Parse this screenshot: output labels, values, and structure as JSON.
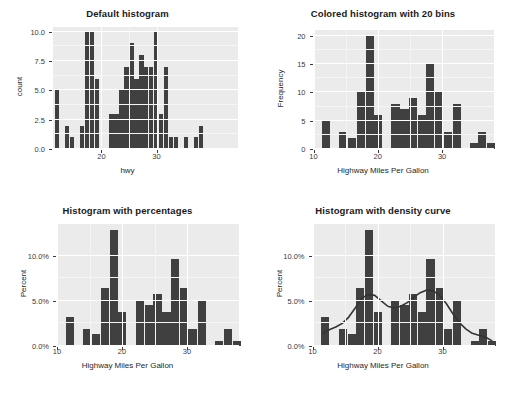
{
  "figure": {
    "layout": "2x2 grid of histogram panels",
    "background": "#ffffff",
    "panel_bg": "#ebebeb",
    "bar_color": "#404040",
    "grid_color": "#ffffff",
    "text_color": "#1a1a1a"
  },
  "panels": [
    {
      "id": "default-histogram",
      "title": "Default histogram",
      "xlabel": "hwy",
      "ylabel": "count"
    },
    {
      "id": "colored-histogram-20-bins",
      "title": "Colored histogram with 20 bins",
      "xlabel": "Highway Miles Per Gallon",
      "ylabel": "Frequency"
    },
    {
      "id": "histogram-percentages",
      "title": "Histogram with percentages",
      "xlabel": "Highway Miles Per Gallon",
      "ylabel": "Percent"
    },
    {
      "id": "histogram-density-curve",
      "title": "Histogram with density curve",
      "xlabel": "Highway Miles Per Gallon",
      "ylabel": "Percent"
    }
  ],
  "chart_data": [
    {
      "type": "bar",
      "id": "default-histogram",
      "title": "Default histogram",
      "xlabel": "hwy",
      "ylabel": "count",
      "bins": 30,
      "binwidth": 0.9,
      "xlim": [
        11.2,
        44.8
      ],
      "ylim": [
        0,
        10.4
      ],
      "xticks": [
        20,
        30
      ],
      "xticklabels": [
        "20",
        "30"
      ],
      "yticks": [
        0.0,
        2.5,
        5.0,
        7.5,
        10.0
      ],
      "yticklabels": [
        "0.0",
        "2.5",
        "5.0",
        "7.5",
        "10.0"
      ],
      "grid": true,
      "legend": "none",
      "bin_centers": [
        12.0,
        12.9,
        13.8,
        14.7,
        15.6,
        16.5,
        17.4,
        18.3,
        19.2,
        20.1,
        21.0,
        21.9,
        22.8,
        23.7,
        24.6,
        25.5,
        26.4,
        27.3,
        28.2,
        29.1,
        30.0,
        30.9,
        31.8,
        32.7,
        33.6,
        34.5,
        35.4,
        36.3,
        37.2,
        38.1,
        41.0,
        44.0
      ],
      "values": [
        5,
        0,
        2,
        1,
        0,
        2,
        10,
        10,
        6,
        0,
        0,
        3,
        3,
        5,
        7,
        9,
        6,
        8,
        7,
        7,
        10,
        3,
        7,
        1,
        1,
        0,
        1,
        0,
        1,
        2,
        0,
        0
      ]
    },
    {
      "type": "bar",
      "id": "colored-histogram-20-bins",
      "title": "Colored histogram with 20 bins",
      "xlabel": "Highway Miles Per Gallon",
      "ylabel": "Frequency",
      "bins": 20,
      "binwidth": 1.35,
      "xlim": [
        10,
        38
      ],
      "ylim": [
        0,
        21
      ],
      "xticks": [
        10,
        20,
        30
      ],
      "xticklabels": [
        "10",
        "20",
        "30"
      ],
      "yticks": [
        0,
        5,
        10,
        15,
        20
      ],
      "yticklabels": [
        "0",
        "5",
        "10",
        "15",
        "20"
      ],
      "grid": true,
      "legend": "none",
      "bin_centers": [
        12.0,
        13.4,
        14.7,
        16.1,
        17.4,
        18.8,
        20.1,
        21.5,
        22.8,
        24.2,
        25.5,
        26.9,
        28.2,
        29.6,
        30.9,
        32.3,
        33.6,
        35.0,
        36.3,
        37.7
      ],
      "values": [
        5,
        0,
        3,
        2,
        10,
        20,
        6,
        0,
        8,
        7,
        9,
        6,
        15,
        10,
        3,
        8,
        0,
        1,
        3,
        1
      ]
    },
    {
      "type": "bar",
      "id": "histogram-percentages",
      "title": "Histogram with percentages",
      "xlabel": "Highway Miles Per Gallon",
      "ylabel": "Percent",
      "bins": 20,
      "binwidth": 1.35,
      "xlim": [
        10,
        38
      ],
      "ylim": [
        0,
        13.5
      ],
      "xticks": [
        10,
        20,
        30
      ],
      "xticklabels": [
        "10",
        "20",
        "30"
      ],
      "yticks": [
        0.0,
        5.0,
        10.0
      ],
      "yticklabels": [
        "0.0%",
        "5.0%",
        "10.0%"
      ],
      "grid": true,
      "legend": "none",
      "bin_centers": [
        12.0,
        13.4,
        14.7,
        16.1,
        17.4,
        18.8,
        20.1,
        21.5,
        22.8,
        24.2,
        25.5,
        26.9,
        28.2,
        29.6,
        30.9,
        32.3,
        33.6,
        35.0,
        36.3,
        37.7
      ],
      "values": [
        3.2,
        0.0,
        1.9,
        1.3,
        6.4,
        12.8,
        3.8,
        0.0,
        5.1,
        4.5,
        5.8,
        3.8,
        9.6,
        6.4,
        1.9,
        5.1,
        0.0,
        0.6,
        1.9,
        0.6
      ]
    },
    {
      "type": "bar",
      "id": "histogram-density-curve",
      "title": "Histogram with density curve",
      "xlabel": "Highway Miles Per Gallon",
      "ylabel": "Percent",
      "bins": 20,
      "binwidth": 1.35,
      "xlim": [
        10,
        38
      ],
      "ylim": [
        0,
        13.5
      ],
      "xticks": [
        10,
        20,
        30
      ],
      "xticklabels": [
        "10",
        "20",
        "30"
      ],
      "yticks": [
        0.0,
        5.0,
        10.0
      ],
      "yticklabels": [
        "0.0%",
        "5.0%",
        "10.0%"
      ],
      "grid": true,
      "legend": "none",
      "bin_centers": [
        12.0,
        13.4,
        14.7,
        16.1,
        17.4,
        18.8,
        20.1,
        21.5,
        22.8,
        24.2,
        25.5,
        26.9,
        28.2,
        29.6,
        30.9,
        32.3,
        33.6,
        35.0,
        36.3,
        37.7
      ],
      "values": [
        3.2,
        0.0,
        1.9,
        1.3,
        6.4,
        12.8,
        3.8,
        0.0,
        5.1,
        4.5,
        5.8,
        3.8,
        9.6,
        6.4,
        1.9,
        5.1,
        0.0,
        0.6,
        1.9,
        0.6
      ],
      "overlay": {
        "type": "line",
        "name": "density curve",
        "color": "#333333",
        "x": [
          11.5,
          12.5,
          13.5,
          14.5,
          15.5,
          16.5,
          17.5,
          18.5,
          19.5,
          20.5,
          21.5,
          22.5,
          23.5,
          24.5,
          25.5,
          26.5,
          27.5,
          28.5,
          29.5,
          30.5,
          31.5,
          32.5,
          33.5,
          34.5,
          35.5,
          36.5,
          37.5
        ],
        "y": [
          1.4,
          1.8,
          2.1,
          2.5,
          3.2,
          4.2,
          5.3,
          5.7,
          5.6,
          5.0,
          4.4,
          4.2,
          4.4,
          4.8,
          5.4,
          5.9,
          6.2,
          6.1,
          5.6,
          4.7,
          3.6,
          2.6,
          1.9,
          1.4,
          1.2,
          1.0,
          0.6
        ]
      }
    }
  ]
}
